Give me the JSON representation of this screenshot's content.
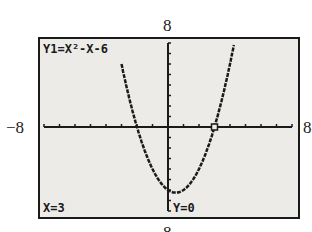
{
  "window": {
    "ymax_label": "8",
    "ymin_label": "8",
    "xmin_label": "−8",
    "xmax_label": "8"
  },
  "screen": {
    "equation_label": "Y1=X²-X-6",
    "trace_x_label": "X=3",
    "trace_y_label": "Y=0",
    "background_color": "#ecebe8",
    "plot_color": "#1a1a1a"
  },
  "chart_data": {
    "type": "line",
    "title": "Y1=X²-X-6",
    "function": "y = x^2 - x - 6",
    "xlim": [
      -8,
      8
    ],
    "ylim": [
      -8,
      8
    ],
    "x_tick_step": 1,
    "y_tick_step": 1,
    "grid": false,
    "x": [
      -3,
      -2,
      -1,
      0,
      0.5,
      1,
      2,
      3,
      4,
      4.5
    ],
    "values": [
      6,
      0,
      -4,
      -6,
      -6.25,
      -6,
      -4,
      0,
      6,
      8.25
    ],
    "trace_point": {
      "x": 3,
      "y": 0
    }
  }
}
